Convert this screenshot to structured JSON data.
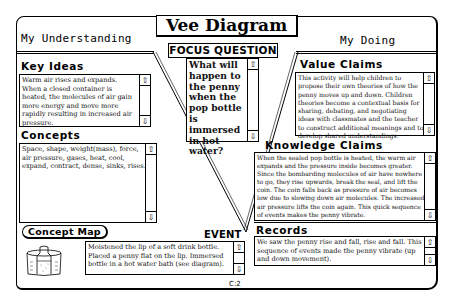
{
  "window": {
    "title": "Vee Diagram",
    "left_heading": "My Understanding",
    "right_heading": "My Doing",
    "page_number": "C:2"
  },
  "focus_question": {
    "label": "FOCUS QUESTION",
    "text": "What will happen to the penny when the pop bottle is immersed in hot water?"
  },
  "key_ideas": {
    "label": "Key Ideas",
    "text": "Warm air rises and expands. When a closed container is heated, the molecules of air gain more energy and move more rapidly resulting in increased air pressure."
  },
  "concepts": {
    "label": "Concepts",
    "text": "Space, shape, weight(mass), force, air pressure, gases, heat, cool, expand, contract, dense, sinks, rises."
  },
  "value_claims": {
    "label": "Value Claims",
    "text": "This activity will help children to propose their own theories of how the penny moves up and down. Children theories become a contextual basis for sharing, debating, and negotiating ideas with classmates and the teacher to construct additional meanings and to develop shared understandings."
  },
  "knowledge_claims": {
    "label": "Knowledge Claims",
    "text": "When the sealed pop bottle is heated, the warm air expands and the pressure inside becomes greater. Since the bombarding molecules of air have nowhere to go, they rise upwards, break the seal, and lift the coin. The coin falls back as pressure of air becomes low due to slowing down air molecules. The increased air pressure lifts the coin again. This quick sequence of events makes the penny vibrate."
  },
  "records": {
    "label": "Records",
    "text": "We saw the penny rise and fall, rise and fall. This sequence of events made the penny vibrate (up and down movement)."
  },
  "event": {
    "label": "EVENT",
    "text": "Moistened the lip of a soft drink bottle. Placed a penny flat on the lip. Immersed bottle in a hot water bath (see diagram)."
  },
  "concept_map_button": {
    "label": "Concept Map"
  },
  "scroll_icons": {
    "up": "⇧",
    "down": "⇩"
  }
}
